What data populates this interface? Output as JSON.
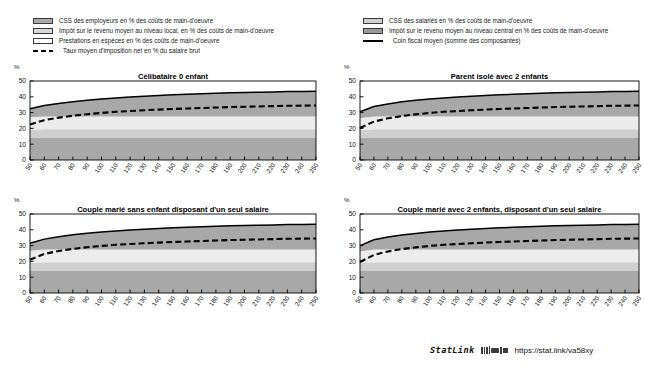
{
  "legend": {
    "left": [
      {
        "kind": "swatch",
        "color": "#a8a8a8",
        "label": "CSS des employeurs en % des coûts de main-d'oeuvre",
        "icon": "legend-swatch-employer-css"
      },
      {
        "kind": "swatch",
        "color": "#d8d8d8",
        "label": "Impôt sur le revenu moyen au niveau local, en % des coûts de main-d'oeuvre",
        "icon": "legend-swatch-local-income-tax"
      },
      {
        "kind": "swatch",
        "color": "#ffffff",
        "label": "Prestations en espèces en % des coûts de main-d'oeuvre",
        "icon": "legend-swatch-cash-benefits"
      },
      {
        "kind": "dash",
        "color": "#000000",
        "label": "Taux moyen d'imposition net en % du salaire brut",
        "icon": "legend-dashed-line-net-tax-rate"
      }
    ],
    "right": [
      {
        "kind": "swatch",
        "color": "#cfcfcf",
        "label": "CSS des salariés en % des coûts de main-d'oeuvre",
        "icon": "legend-swatch-employee-css"
      },
      {
        "kind": "swatch",
        "color": "#9a9a9a",
        "label": "Impôt sur le revenu moyen au niveau central en %  des coûts de main-d'oeuvre",
        "icon": "legend-swatch-central-income-tax"
      },
      {
        "kind": "solid",
        "color": "#000000",
        "label": "Coin fiscal moyen (somme des composantes)",
        "icon": "legend-solid-line-tax-wedge"
      }
    ]
  },
  "footer": {
    "statlink_word": "StatLink",
    "url": "https://stat.link/va58xy",
    "glyph": "statlink-barcode-icon"
  },
  "chart_data": [
    {
      "id": "celibataire-0-enfant",
      "type": "area",
      "title": "Célibataire 0 enfant",
      "xlabel": "",
      "ylabel": "%",
      "ylim": [
        0,
        50
      ],
      "yticks": [
        0,
        10,
        20,
        30,
        40,
        50
      ],
      "xlim": [
        50,
        250
      ],
      "xticks": [
        50,
        60,
        70,
        80,
        90,
        100,
        110,
        120,
        130,
        140,
        150,
        160,
        170,
        180,
        190,
        200,
        210,
        220,
        230,
        240,
        250
      ],
      "x": [
        50,
        60,
        70,
        80,
        90,
        100,
        110,
        120,
        130,
        140,
        150,
        160,
        170,
        180,
        190,
        200,
        210,
        220,
        230,
        240,
        250
      ],
      "grid": false,
      "legend_position": "above-figure",
      "series": [
        {
          "name": "CSS des employeurs en % des coûts de main-d'oeuvre",
          "color": "#a8a8a8",
          "stack": 1,
          "values": [
            14.0,
            14.0,
            14.0,
            14.0,
            14.0,
            14.0,
            14.0,
            14.0,
            14.0,
            14.0,
            14.0,
            14.0,
            14.0,
            14.0,
            14.0,
            14.0,
            14.0,
            14.0,
            14.0,
            14.0,
            14.0
          ]
        },
        {
          "name": "CSS des salariés en % des coûts de main-d'oeuvre",
          "color": "#cfcfcf",
          "stack": 2,
          "values": [
            5.0,
            5.5,
            5.5,
            5.5,
            5.5,
            5.5,
            5.5,
            5.5,
            5.5,
            5.5,
            5.5,
            5.5,
            5.5,
            5.5,
            5.5,
            5.5,
            5.5,
            5.5,
            5.5,
            5.5,
            5.5
          ]
        },
        {
          "name": "Impôt sur le revenu moyen au niveau local, en % des coûts de main-d'oeuvre",
          "color": "#ececec",
          "stack": 3,
          "values": [
            8.0,
            8.0,
            8.0,
            8.0,
            8.0,
            8.0,
            8.0,
            8.0,
            8.0,
            8.0,
            8.0,
            8.0,
            8.0,
            8.0,
            8.0,
            8.0,
            8.0,
            8.0,
            8.0,
            8.0,
            8.0
          ]
        },
        {
          "name": "Impôt sur le revenu moyen au niveau central en %  des coûts de main-d'oeuvre",
          "color": "#a8a8a8",
          "stack": 4,
          "values": [
            5.5,
            7.0,
            8.3,
            9.4,
            10.3,
            11.1,
            11.8,
            12.4,
            12.9,
            13.4,
            13.8,
            14.1,
            14.4,
            14.7,
            15.0,
            15.2,
            15.4,
            15.6,
            15.8,
            15.9,
            16.0
          ]
        }
      ],
      "lines": [
        {
          "name": "Coin fiscal moyen (somme des composantes)",
          "style": "solid",
          "color": "#000000",
          "values": [
            32.5,
            34.5,
            35.8,
            36.9,
            37.8,
            38.6,
            39.3,
            39.9,
            40.4,
            40.9,
            41.3,
            41.6,
            41.9,
            42.2,
            42.5,
            42.7,
            42.9,
            43.1,
            43.3,
            43.4,
            43.5
          ]
        },
        {
          "name": "Taux moyen d'imposition net en % du salaire brut",
          "style": "dashed",
          "color": "#000000",
          "values": [
            22.5,
            25.2,
            26.8,
            28.0,
            29.0,
            29.8,
            30.5,
            31.0,
            31.5,
            31.9,
            32.3,
            32.6,
            32.9,
            33.2,
            33.5,
            33.7,
            33.9,
            34.1,
            34.3,
            34.4,
            34.5
          ]
        }
      ]
    },
    {
      "id": "parent-isole-2-enfants",
      "type": "area",
      "title": "Parent isolé avec 2 enfants",
      "xlabel": "",
      "ylabel": "%",
      "ylim": [
        0,
        50
      ],
      "yticks": [
        0,
        10,
        20,
        30,
        40,
        50
      ],
      "xlim": [
        50,
        250
      ],
      "xticks": [
        50,
        60,
        70,
        80,
        90,
        100,
        110,
        120,
        130,
        140,
        150,
        160,
        170,
        180,
        190,
        200,
        210,
        220,
        230,
        240,
        250
      ],
      "x": [
        50,
        60,
        70,
        80,
        90,
        100,
        110,
        120,
        130,
        140,
        150,
        160,
        170,
        180,
        190,
        200,
        210,
        220,
        230,
        240,
        250
      ],
      "grid": false,
      "legend_position": "above-figure",
      "series": [
        {
          "name": "CSS des employeurs en % des coûts de main-d'oeuvre",
          "color": "#a8a8a8",
          "stack": 1,
          "values": [
            14.0,
            14.0,
            14.0,
            14.0,
            14.0,
            14.0,
            14.0,
            14.0,
            14.0,
            14.0,
            14.0,
            14.0,
            14.0,
            14.0,
            14.0,
            14.0,
            14.0,
            14.0,
            14.0,
            14.0,
            14.0
          ]
        },
        {
          "name": "CSS des salariés en % des coûts de main-d'oeuvre",
          "color": "#cfcfcf",
          "stack": 2,
          "values": [
            5.0,
            5.5,
            5.5,
            5.5,
            5.5,
            5.5,
            5.5,
            5.5,
            5.5,
            5.5,
            5.5,
            5.5,
            5.5,
            5.5,
            5.5,
            5.5,
            5.5,
            5.5,
            5.5,
            5.5,
            5.5
          ]
        },
        {
          "name": "Impôt sur le revenu moyen au niveau local, en % des coûts de main-d'oeuvre",
          "color": "#ececec",
          "stack": 3,
          "values": [
            7.5,
            8.0,
            8.0,
            8.0,
            8.0,
            8.0,
            8.0,
            8.0,
            8.0,
            8.0,
            8.0,
            8.0,
            8.0,
            8.0,
            8.0,
            8.0,
            8.0,
            8.0,
            8.0,
            8.0,
            8.0
          ]
        },
        {
          "name": "Impôt sur le revenu moyen au niveau central en %  des coûts de main-d'oeuvre",
          "color": "#a8a8a8",
          "stack": 4,
          "values": [
            4.0,
            6.3,
            8.0,
            9.3,
            10.3,
            11.1,
            11.8,
            12.4,
            12.9,
            13.4,
            13.8,
            14.1,
            14.4,
            14.7,
            15.0,
            15.2,
            15.4,
            15.6,
            15.8,
            15.9,
            16.0
          ]
        }
      ],
      "lines": [
        {
          "name": "Coin fiscal moyen (somme des composantes)",
          "style": "solid",
          "color": "#000000",
          "values": [
            30.5,
            33.8,
            35.5,
            36.8,
            37.8,
            38.6,
            39.3,
            39.9,
            40.4,
            40.9,
            41.3,
            41.6,
            41.9,
            42.2,
            42.5,
            42.7,
            42.9,
            43.1,
            43.3,
            43.4,
            43.5
          ]
        },
        {
          "name": "Taux moyen d'imposition net en % du salaire brut",
          "style": "dashed",
          "color": "#000000",
          "values": [
            20.3,
            24.3,
            26.4,
            27.8,
            28.9,
            29.8,
            30.5,
            31.0,
            31.5,
            31.9,
            32.3,
            32.6,
            32.9,
            33.2,
            33.5,
            33.7,
            33.9,
            34.1,
            34.3,
            34.4,
            34.5
          ]
        }
      ]
    },
    {
      "id": "couple-marie-sans-enfant-un-seul-salaire",
      "type": "area",
      "title": "Couple marié sans enfant disposant d'un seul salaire",
      "xlabel": "",
      "ylabel": "%",
      "ylim": [
        0,
        50
      ],
      "yticks": [
        0,
        10,
        20,
        30,
        40,
        50
      ],
      "xlim": [
        50,
        250
      ],
      "xticks": [
        50,
        60,
        70,
        80,
        90,
        100,
        110,
        120,
        130,
        140,
        150,
        160,
        170,
        180,
        190,
        200,
        210,
        220,
        230,
        240,
        250
      ],
      "x": [
        50,
        60,
        70,
        80,
        90,
        100,
        110,
        120,
        130,
        140,
        150,
        160,
        170,
        180,
        190,
        200,
        210,
        220,
        230,
        240,
        250
      ],
      "grid": false,
      "legend_position": "above-figure",
      "series": [
        {
          "name": "CSS des employeurs en % des coûts de main-d'oeuvre",
          "color": "#a8a8a8",
          "stack": 1,
          "values": [
            14.0,
            14.0,
            14.0,
            14.0,
            14.0,
            14.0,
            14.0,
            14.0,
            14.0,
            14.0,
            14.0,
            14.0,
            14.0,
            14.0,
            14.0,
            14.0,
            14.0,
            14.0,
            14.0,
            14.0,
            14.0
          ]
        },
        {
          "name": "CSS des salariés en % des coûts de main-d'oeuvre",
          "color": "#cfcfcf",
          "stack": 2,
          "values": [
            5.0,
            5.5,
            5.5,
            5.5,
            5.5,
            5.5,
            5.5,
            5.5,
            5.5,
            5.5,
            5.5,
            5.5,
            5.5,
            5.5,
            5.5,
            5.5,
            5.5,
            5.5,
            5.5,
            5.5,
            5.5
          ]
        },
        {
          "name": "Impôt sur le revenu moyen au niveau local, en % des coûts de main-d'oeuvre",
          "color": "#ececec",
          "stack": 3,
          "values": [
            7.8,
            8.0,
            8.0,
            8.0,
            8.0,
            8.0,
            8.0,
            8.0,
            8.0,
            8.0,
            8.0,
            8.0,
            8.0,
            8.0,
            8.0,
            8.0,
            8.0,
            8.0,
            8.0,
            8.0,
            8.0
          ]
        },
        {
          "name": "Impôt sur le revenu moyen au niveau central en %  des coûts de main-d'oeuvre",
          "color": "#a8a8a8",
          "stack": 4,
          "values": [
            4.7,
            6.6,
            8.1,
            9.3,
            10.3,
            11.1,
            11.8,
            12.4,
            12.9,
            13.4,
            13.8,
            14.1,
            14.4,
            14.7,
            15.0,
            15.2,
            15.4,
            15.6,
            15.8,
            15.9,
            16.0
          ]
        }
      ],
      "lines": [
        {
          "name": "Coin fiscal moyen (somme des composantes)",
          "style": "solid",
          "color": "#000000",
          "values": [
            31.5,
            34.1,
            35.6,
            36.8,
            37.8,
            38.6,
            39.3,
            39.9,
            40.4,
            40.9,
            41.3,
            41.6,
            41.9,
            42.2,
            42.5,
            42.7,
            42.9,
            43.1,
            43.3,
            43.4,
            43.5
          ]
        },
        {
          "name": "Taux moyen d'imposition net en % du salaire brut",
          "style": "dashed",
          "color": "#000000",
          "values": [
            21.0,
            24.7,
            26.6,
            27.9,
            29.0,
            29.8,
            30.5,
            31.0,
            31.5,
            31.9,
            32.3,
            32.6,
            32.9,
            33.2,
            33.5,
            33.7,
            33.9,
            34.1,
            34.3,
            34.4,
            34.5
          ]
        }
      ]
    },
    {
      "id": "couple-marie-2-enfants-un-seul-salaire",
      "type": "area",
      "title": "Couple marié avec 2 enfants, disposant d'un seul salaire",
      "xlabel": "",
      "ylabel": "%",
      "ylim": [
        0,
        50
      ],
      "yticks": [
        0,
        10,
        20,
        30,
        40,
        50
      ],
      "xlim": [
        50,
        250
      ],
      "xticks": [
        50,
        60,
        70,
        80,
        90,
        100,
        110,
        120,
        130,
        140,
        150,
        160,
        170,
        180,
        190,
        200,
        210,
        220,
        230,
        240,
        250
      ],
      "x": [
        50,
        60,
        70,
        80,
        90,
        100,
        110,
        120,
        130,
        140,
        150,
        160,
        170,
        180,
        190,
        200,
        210,
        220,
        230,
        240,
        250
      ],
      "grid": false,
      "legend_position": "above-figure",
      "series": [
        {
          "name": "CSS des employeurs en % des coûts de main-d'oeuvre",
          "color": "#a8a8a8",
          "stack": 1,
          "values": [
            14.0,
            14.0,
            14.0,
            14.0,
            14.0,
            14.0,
            14.0,
            14.0,
            14.0,
            14.0,
            14.0,
            14.0,
            14.0,
            14.0,
            14.0,
            14.0,
            14.0,
            14.0,
            14.0,
            14.0,
            14.0
          ]
        },
        {
          "name": "CSS des salariés en % des coûts de main-d'oeuvre",
          "color": "#cfcfcf",
          "stack": 2,
          "values": [
            5.0,
            5.5,
            5.5,
            5.5,
            5.5,
            5.5,
            5.5,
            5.5,
            5.5,
            5.5,
            5.5,
            5.5,
            5.5,
            5.5,
            5.5,
            5.5,
            5.5,
            5.5,
            5.5,
            5.5,
            5.5
          ]
        },
        {
          "name": "Impôt sur le revenu moyen au niveau local, en % des coûts de main-d'oeuvre",
          "color": "#ececec",
          "stack": 3,
          "values": [
            7.2,
            8.0,
            8.0,
            8.0,
            8.0,
            8.0,
            8.0,
            8.0,
            8.0,
            8.0,
            8.0,
            8.0,
            8.0,
            8.0,
            8.0,
            8.0,
            8.0,
            8.0,
            8.0,
            8.0,
            8.0
          ]
        },
        {
          "name": "Impôt sur le revenu moyen au niveau central en %  des coûts de main-d'oeuvre",
          "color": "#a8a8a8",
          "stack": 4,
          "values": [
            3.8,
            6.2,
            7.9,
            9.2,
            10.2,
            11.1,
            11.8,
            12.4,
            12.9,
            13.4,
            13.8,
            14.1,
            14.4,
            14.7,
            15.0,
            15.2,
            15.4,
            15.6,
            15.8,
            15.9,
            16.0
          ]
        }
      ],
      "lines": [
        {
          "name": "Coin fiscal moyen (somme des composantes)",
          "style": "solid",
          "color": "#000000",
          "values": [
            30.0,
            33.7,
            35.4,
            36.7,
            37.7,
            38.6,
            39.3,
            39.9,
            40.4,
            40.9,
            41.3,
            41.6,
            41.9,
            42.2,
            42.5,
            42.7,
            42.9,
            43.1,
            43.3,
            43.4,
            43.5
          ]
        },
        {
          "name": "Taux moyen d'imposition net en % du salaire brut",
          "style": "dashed",
          "color": "#000000",
          "values": [
            19.6,
            24.1,
            26.3,
            27.8,
            28.9,
            29.8,
            30.5,
            31.0,
            31.5,
            31.9,
            32.3,
            32.6,
            32.9,
            33.2,
            33.5,
            33.7,
            33.9,
            34.1,
            34.3,
            34.4,
            34.5
          ]
        }
      ]
    }
  ]
}
